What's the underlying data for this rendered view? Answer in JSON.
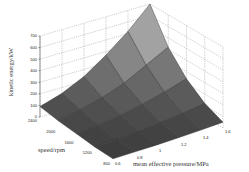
{
  "chart_data": {
    "type": "surface3d",
    "title": "",
    "xlabel": "mean effective pressure/MPa",
    "ylabel": "speed/rpm",
    "zlabel": "kinetic energy/kW",
    "x_ticks": [
      "0.6",
      "0.8",
      "1",
      "1.2",
      "1.4",
      "1.6"
    ],
    "y_ticks": [
      "800",
      "1200",
      "1600",
      "2000",
      "2400"
    ],
    "z_ticks": [
      "0",
      "100",
      "200",
      "300",
      "400",
      "500",
      "600",
      "700"
    ],
    "xlim": [
      0.6,
      1.6
    ],
    "ylim": [
      800,
      2400
    ],
    "zlim": [
      0,
      700
    ],
    "grid": true,
    "x": [
      0.6,
      0.8,
      1.0,
      1.2,
      1.4,
      1.6
    ],
    "y": [
      800,
      1200,
      1600,
      2000,
      2400
    ],
    "z": [
      [
        10,
        15,
        20,
        28,
        38,
        50
      ],
      [
        20,
        30,
        45,
        65,
        90,
        120
      ],
      [
        40,
        60,
        90,
        130,
        180,
        240
      ],
      [
        60,
        100,
        150,
        220,
        320,
        420
      ],
      [
        90,
        150,
        240,
        370,
        520,
        700
      ]
    ],
    "colormap": "gray"
  },
  "labels": {
    "zlabel": "kinetic energy/kW",
    "ylabel": "speed/rpm",
    "xlabel": "mean effective pressure/MPa"
  }
}
